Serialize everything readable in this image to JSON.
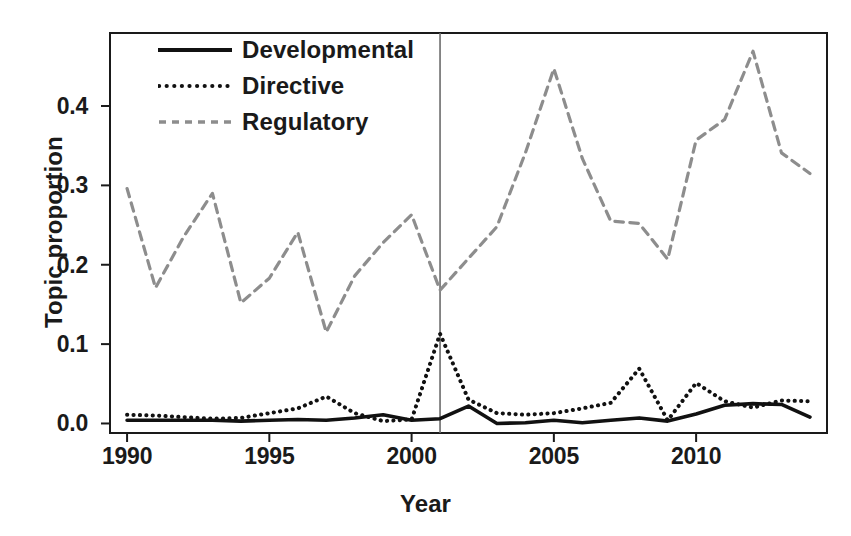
{
  "chart_data": {
    "type": "line",
    "title": "",
    "xlabel": "Year",
    "ylabel": "Topic proportion",
    "xlim": [
      1989.4,
      2014.6
    ],
    "ylim": [
      -0.012,
      0.492
    ],
    "xticks": [
      1990,
      1995,
      2000,
      2005,
      2010
    ],
    "yticks": [
      0.0,
      0.1,
      0.2,
      0.3,
      0.4
    ],
    "ytick_labels": [
      "0.0",
      "0.1",
      "0.2",
      "0.3",
      "0.4"
    ],
    "xtick_labels": [
      "1990",
      "1995",
      "2000",
      "2005",
      "2010"
    ],
    "grid": false,
    "legend_position": "top-left-inside",
    "annotations": [
      {
        "type": "vline",
        "x": 2001,
        "label": "2001 reference line",
        "color": "#6b6b6b"
      }
    ],
    "x": [
      1990,
      1991,
      1992,
      1993,
      1994,
      1995,
      1996,
      1997,
      1998,
      1999,
      2000,
      2001,
      2002,
      2003,
      2004,
      2005,
      2006,
      2007,
      2008,
      2009,
      2010,
      2011,
      2012,
      2013,
      2014
    ],
    "series": [
      {
        "name": "Developmental",
        "style": "solid",
        "color": "#111111",
        "values": [
          0.004,
          0.004,
          0.004,
          0.004,
          0.003,
          0.004,
          0.005,
          0.004,
          0.007,
          0.011,
          0.004,
          0.006,
          0.022,
          0.0,
          0.001,
          0.004,
          0.001,
          0.004,
          0.007,
          0.003,
          0.012,
          0.023,
          0.025,
          0.024,
          0.008
        ]
      },
      {
        "name": "Directive",
        "style": "dotted",
        "color": "#111111",
        "values": [
          0.011,
          0.01,
          0.008,
          0.006,
          0.007,
          0.013,
          0.019,
          0.034,
          0.013,
          0.003,
          0.005,
          0.113,
          0.03,
          0.013,
          0.011,
          0.013,
          0.019,
          0.026,
          0.069,
          0.004,
          0.051,
          0.028,
          0.02,
          0.029,
          0.028
        ]
      },
      {
        "name": "Regulatory",
        "style": "dashed",
        "color": "#8d8d8d",
        "values": [
          0.296,
          0.171,
          0.236,
          0.29,
          0.152,
          0.183,
          0.241,
          0.115,
          0.186,
          0.228,
          0.263,
          0.168,
          0.208,
          0.248,
          0.341,
          0.447,
          0.334,
          0.255,
          0.252,
          0.207,
          0.357,
          0.383,
          0.469,
          0.341,
          0.315
        ]
      }
    ]
  },
  "legend": {
    "entries": [
      {
        "label": "Developmental",
        "style": "solid"
      },
      {
        "label": "Directive",
        "style": "dotted"
      },
      {
        "label": "Regulatory",
        "style": "dashed"
      }
    ]
  },
  "colors": {
    "axis": "#1a1a1a",
    "text": "#1a1a1a",
    "developmental": "#111111",
    "directive": "#111111",
    "regulatory": "#8d8d8d",
    "vline": "#6b6b6b",
    "background": "#ffffff"
  }
}
